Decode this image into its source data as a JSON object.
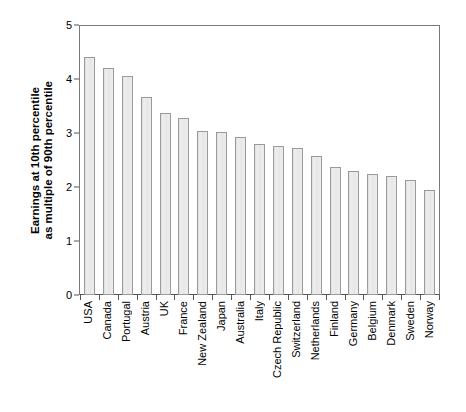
{
  "chart_data": {
    "type": "bar",
    "title": "",
    "subtitle": "",
    "xlabel": "",
    "ylabel": "Earnings at 10th percentile as multiple of 90th percentile",
    "ylabel_lines": [
      "Earnings at 10th percentile",
      "as multiple of 90th percentile"
    ],
    "ylim": [
      0,
      5
    ],
    "yticks": [
      0,
      1,
      2,
      3,
      4,
      5
    ],
    "ytick_labels": [
      "0",
      "1",
      "2",
      "3",
      "4",
      "5"
    ],
    "grid": false,
    "legend": false,
    "legend_position": "none",
    "bar_fill_color": "#e9e9e9",
    "bar_edge_color": "#9a9a9a",
    "axis_color": "#555555",
    "categories": [
      "USA",
      "Canada",
      "Portugal",
      "Austria",
      "UK",
      "France",
      "New Zealand",
      "Japan",
      "Australia",
      "Italy",
      "Czech Republic",
      "Switzerland",
      "Netherlands",
      "Finland",
      "Germany",
      "Belgium",
      "Denmark",
      "Sweden",
      "Norway"
    ],
    "values": [
      4.4,
      4.2,
      4.05,
      3.67,
      3.37,
      3.27,
      3.04,
      3.02,
      2.93,
      2.79,
      2.76,
      2.72,
      2.58,
      2.37,
      2.3,
      2.25,
      2.2,
      2.13,
      1.95
    ]
  }
}
